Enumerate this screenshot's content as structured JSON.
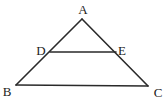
{
  "diagram": {
    "type": "triangle-with-midsegment",
    "points": {
      "A": {
        "label": "A",
        "x": 82,
        "y": 19,
        "lx": 83,
        "ly": 14
      },
      "B": {
        "label": "B",
        "x": 16,
        "y": 85,
        "lx": 7,
        "ly": 96
      },
      "C": {
        "label": "C",
        "x": 148,
        "y": 86,
        "lx": 158,
        "ly": 97
      },
      "D": {
        "label": "D",
        "x": 50,
        "y": 52,
        "lx": 41,
        "ly": 55
      },
      "E": {
        "label": "E",
        "x": 116,
        "y": 52,
        "lx": 122,
        "ly": 55
      }
    },
    "segments": [
      "AB",
      "AC",
      "BC",
      "DE"
    ],
    "stroke_color": "#2a2a2a"
  }
}
